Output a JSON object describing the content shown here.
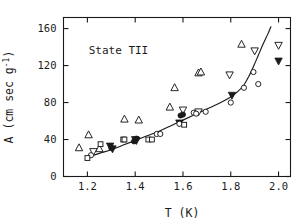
{
  "figure": {
    "annotation": "State TII",
    "background": "#ffffff",
    "ink": "#1a1a1a"
  },
  "chart_data": {
    "type": "scatter",
    "title": "",
    "subtitle": "",
    "annotations": [
      {
        "text": "State TII",
        "x": 1.33,
        "y": 132
      }
    ],
    "xlabel": "T  (K)",
    "ylabel": "A (cm sec g⁻¹)",
    "ylabel_parts": {
      "main": "A (cm sec g",
      "sup": "-1",
      "tail": ")"
    },
    "xlim": [
      1.1,
      2.05
    ],
    "ylim": [
      0,
      172
    ],
    "xticks": [
      1.2,
      1.4,
      1.6,
      1.8,
      2.0
    ],
    "xticklabels": [
      "1.2",
      "1.4",
      "1.6",
      "1.8",
      "2.0"
    ],
    "yticks": [
      0,
      40,
      80,
      120,
      160
    ],
    "yticklabels": [
      "0",
      "40",
      "80",
      "120",
      "160"
    ],
    "grid": false,
    "legend": "none",
    "frame": "box",
    "ticks_inward": true,
    "series": [
      {
        "name": "open-triangle-up",
        "marker": "triangle-up",
        "filled": false,
        "points": [
          [
            1.165,
            31
          ],
          [
            1.205,
            45
          ],
          [
            1.25,
            30
          ],
          [
            1.355,
            62
          ],
          [
            1.415,
            61
          ],
          [
            1.545,
            75
          ],
          [
            1.565,
            96
          ],
          [
            1.665,
            112
          ],
          [
            1.675,
            113
          ],
          [
            1.845,
            143
          ]
        ]
      },
      {
        "name": "open-triangle-down",
        "marker": "triangle-down",
        "filled": false,
        "points": [
          [
            1.225,
            27
          ],
          [
            1.6,
            72
          ],
          [
            1.665,
            70
          ],
          [
            1.795,
            110
          ],
          [
            1.9,
            136
          ],
          [
            2.0,
            142
          ]
        ]
      },
      {
        "name": "filled-triangle-down",
        "marker": "triangle-down",
        "filled": true,
        "points": [
          [
            1.295,
            33
          ],
          [
            1.305,
            30
          ],
          [
            1.4,
            40
          ],
          [
            1.405,
            39
          ],
          [
            1.585,
            58
          ],
          [
            1.805,
            88
          ],
          [
            2.0,
            125
          ]
        ]
      },
      {
        "name": "filled-circle",
        "marker": "circle",
        "filled": true,
        "points": [
          [
            1.3,
            31
          ],
          [
            1.395,
            38
          ],
          [
            1.405,
            41
          ],
          [
            1.59,
            66
          ],
          [
            1.6,
            67
          ]
        ]
      },
      {
        "name": "open-circle",
        "marker": "circle",
        "filled": false,
        "points": [
          [
            1.215,
            23
          ],
          [
            1.49,
            46
          ],
          [
            1.505,
            46
          ],
          [
            1.585,
            57
          ],
          [
            1.645,
            69
          ],
          [
            1.655,
            68
          ],
          [
            1.695,
            70
          ],
          [
            1.8,
            80
          ],
          [
            1.855,
            96
          ],
          [
            1.895,
            113
          ],
          [
            1.915,
            100
          ]
        ]
      },
      {
        "name": "open-square",
        "marker": "square",
        "filled": false,
        "points": [
          [
            1.2,
            20
          ],
          [
            1.255,
            35
          ],
          [
            1.35,
            40
          ],
          [
            1.355,
            40
          ],
          [
            1.455,
            40
          ],
          [
            1.47,
            40
          ],
          [
            1.605,
            56
          ]
        ]
      }
    ],
    "fit_curve": {
      "name": "fitted-curve",
      "style": "solid",
      "points": [
        [
          1.205,
          21
        ],
        [
          1.25,
          25
        ],
        [
          1.3,
          29
        ],
        [
          1.35,
          34
        ],
        [
          1.4,
          39
        ],
        [
          1.45,
          44
        ],
        [
          1.5,
          49
        ],
        [
          1.55,
          55
        ],
        [
          1.6,
          61
        ],
        [
          1.65,
          67
        ],
        [
          1.7,
          73
        ],
        [
          1.75,
          79
        ],
        [
          1.8,
          86
        ],
        [
          1.83,
          92
        ],
        [
          1.855,
          99
        ],
        [
          1.875,
          108
        ],
        [
          1.895,
          119
        ],
        [
          1.915,
          131
        ],
        [
          1.935,
          143
        ],
        [
          1.955,
          154
        ],
        [
          1.968,
          162
        ]
      ]
    }
  }
}
